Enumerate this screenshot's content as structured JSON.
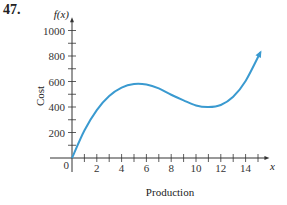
{
  "problem_number": "47.",
  "chart_data": {
    "type": "line",
    "title": "",
    "xlabel": "Production",
    "ylabel": "Cost",
    "x_axis_symbol": "x",
    "y_axis_symbol": "f(x)",
    "origin_label": "0",
    "xlim": [
      0,
      15.5
    ],
    "ylim": [
      0,
      1050
    ],
    "x_ticks": [
      1,
      2,
      3,
      4,
      5,
      6,
      7,
      8,
      9,
      10,
      11,
      12,
      13,
      14,
      15
    ],
    "x_tick_labels": [
      {
        "value": 2,
        "label": "2"
      },
      {
        "value": 4,
        "label": "4"
      },
      {
        "value": 6,
        "label": "6"
      },
      {
        "value": 8,
        "label": "8"
      },
      {
        "value": 10,
        "label": "10"
      },
      {
        "value": 12,
        "label": "12"
      },
      {
        "value": 14,
        "label": "14"
      }
    ],
    "y_ticks": [
      100,
      200,
      300,
      400,
      500,
      600,
      700,
      800,
      900,
      1000
    ],
    "y_tick_labels": [
      {
        "value": 200,
        "label": "200"
      },
      {
        "value": 400,
        "label": "400"
      },
      {
        "value": 600,
        "label": "600"
      },
      {
        "value": 800,
        "label": "800"
      },
      {
        "value": 1000,
        "label": "1000"
      }
    ],
    "grid": false,
    "series": [
      {
        "name": "f(x)",
        "color": "#3a9ad0",
        "end_arrow": true,
        "x": [
          0,
          1,
          2,
          3,
          4,
          5,
          6,
          7,
          8,
          9,
          10,
          11,
          12,
          13,
          14,
          15.2
        ],
        "y": [
          0,
          216,
          376,
          486,
          552,
          580,
          576,
          546,
          496,
          452,
          412,
          400,
          416,
          480,
          604,
          830
        ]
      }
    ]
  }
}
